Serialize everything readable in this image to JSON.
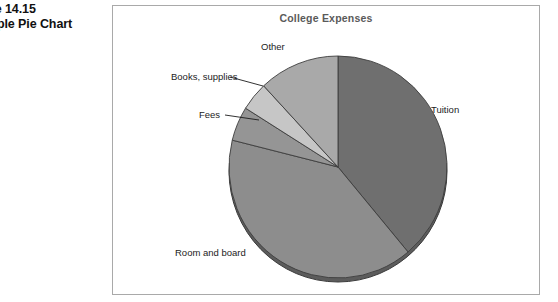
{
  "figure": {
    "caption_line1": "Figure 14.15",
    "caption_line2": "Example Pie Chart"
  },
  "chart_data": {
    "type": "pie",
    "title": "College Expenses",
    "xlabel": "",
    "ylabel": "",
    "legend": "none (direct slice labels)",
    "grid": false,
    "start_angle_deg": 0,
    "direction": "clockwise",
    "categories": [
      "Tuition",
      "Room and board",
      "Fees",
      "Books, supplies",
      "Other"
    ],
    "values": [
      39,
      40,
      5,
      4,
      12
    ],
    "slices": [
      {
        "label": "Tuition",
        "value": 39,
        "color": "#6f6f6f",
        "start_deg": 0,
        "end_deg": 140
      },
      {
        "label": "Room and board",
        "value": 40,
        "color": "#8d8d8d",
        "start_deg": 140,
        "end_deg": 284
      },
      {
        "label": "Fees",
        "value": 5,
        "color": "#959595",
        "start_deg": 284,
        "end_deg": 302
      },
      {
        "label": "Books, supplies",
        "value": 4,
        "color": "#c6c6c6",
        "start_deg": 302,
        "end_deg": 317
      },
      {
        "label": "Other",
        "value": 12,
        "color": "#a9a9a9",
        "start_deg": 317,
        "end_deg": 360
      }
    ]
  },
  "colors": {
    "frame_border": "#a9a9a9",
    "title_text": "#5a5a5a",
    "label_text": "#1c1c1c",
    "pie_outline": "#3d3d3d",
    "pie_depth_shadow": "#5c5c5c",
    "background": "#ffffff"
  }
}
